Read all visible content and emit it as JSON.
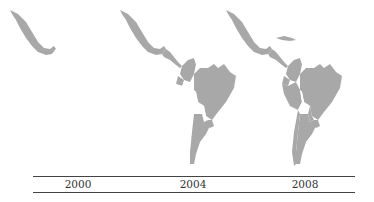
{
  "figure": {
    "type": "choropleth small multiples",
    "region": "Latin America",
    "colors": {
      "shaded": "#a8a8a8",
      "unshaded": "#ffffff",
      "outline": "#2a2a2a"
    }
  },
  "panels": [
    {
      "label": "2000",
      "shaded": [
        "Mexico"
      ],
      "unshaded": [
        "Guatemala",
        "Honduras",
        "Nicaragua",
        "El Salvador",
        "Costa Rica",
        "Panama",
        "Cuba",
        "Colombia",
        "Venezuela",
        "Guyana",
        "Suriname",
        "Ecuador",
        "Peru",
        "Brazil",
        "Bolivia",
        "Paraguay",
        "Chile",
        "Argentina",
        "Uruguay"
      ]
    },
    {
      "label": "2004",
      "shaded": [
        "Mexico",
        "Guatemala",
        "Honduras",
        "El Salvador",
        "Nicaragua",
        "Colombia",
        "Ecuador",
        "Brazil",
        "Argentina",
        "Uruguay"
      ],
      "unshaded": [
        "Cuba",
        "Costa Rica",
        "Panama",
        "Venezuela",
        "Guyana",
        "Suriname",
        "Peru",
        "Bolivia",
        "Paraguay",
        "Chile"
      ]
    },
    {
      "label": "2008",
      "shaded": [
        "Mexico",
        "Guatemala",
        "Honduras",
        "El Salvador",
        "Nicaragua",
        "Costa Rica",
        "Panama",
        "Cuba",
        "Colombia",
        "Ecuador",
        "Peru",
        "Brazil",
        "Paraguay",
        "Chile",
        "Argentina",
        "Uruguay"
      ],
      "unshaded": [
        "Venezuela",
        "Guyana",
        "Suriname",
        "Bolivia"
      ]
    }
  ]
}
